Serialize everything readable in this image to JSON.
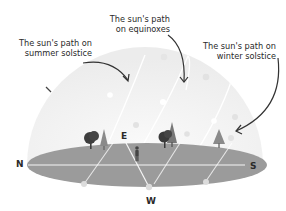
{
  "diagram": {
    "labels": {
      "summer": "The sun's path on summer solstice",
      "summer_line1": "The sun's path on",
      "summer_line2": "summer solstice",
      "equinox": "The sun's path on equinoxes",
      "equinox_line1": "The sun's path",
      "equinox_line2": "on equinoxes",
      "winter": "The sun's path on winter solstice",
      "winter_line1": "The sun's path on",
      "winter_line2": "winter solstice"
    },
    "directions": {
      "north": "N",
      "east": "E",
      "south": "S",
      "west": "W"
    },
    "colors": {
      "dome": "#f1f1f1",
      "ground": "#9a9a9a",
      "ground_edge": "#8c8c8c",
      "path": "#ffffff",
      "sun_dot": "#e2e2e2",
      "tree_dark": "#3d3d3d",
      "tree_light": "#7a7a7a",
      "arrow": "#333333",
      "text": "#2a2a2a"
    },
    "icons": [
      "sun-icon",
      "tree-icon",
      "person-icon",
      "arrow-icon"
    ]
  }
}
